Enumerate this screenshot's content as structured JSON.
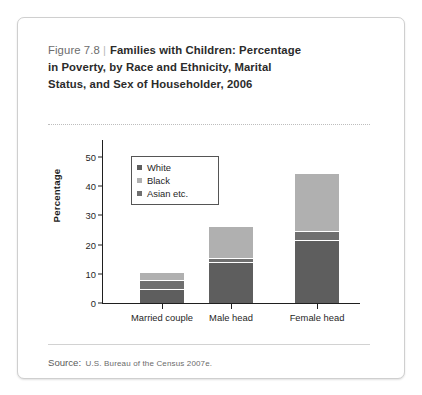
{
  "figure": {
    "number_label": "Figure 7.8",
    "separator": "|",
    "title_line1": "Families with Children: Percentage",
    "title_line2": "in Poverty, by Race and Ethnicity, Marital",
    "title_line3": "Status, and Sex of Householder, 2006",
    "source_label": "Source:",
    "source_text": "U.S. Bureau of the Census 2007e."
  },
  "colors": {
    "white_series": "#5e5e5e",
    "black_series": "#b0b0b0",
    "asian_series": "#6f6f6f",
    "axis": "#1f1f1f",
    "card_border": "#cfcfcf",
    "divider": "#bdbdbd"
  },
  "chart_data": {
    "type": "bar",
    "stacked": true,
    "title": "Families with Children: Percentage in Poverty, by Race and Ethnicity, Marital Status, and Sex of Householder, 2006",
    "xlabel": "",
    "ylabel": "Percentage",
    "ylim": [
      0,
      50
    ],
    "yticks": [
      0,
      10,
      20,
      30,
      40,
      50
    ],
    "ytick_labels": [
      "0",
      "10",
      "20",
      "30",
      "40",
      "50"
    ],
    "grid": false,
    "legend_position": "upper-left-inside",
    "categories": [
      "Married couple",
      "Male head",
      "Female head"
    ],
    "series": [
      {
        "name": "White",
        "values": [
          4.8,
          14.0,
          21.5
        ]
      },
      {
        "name": "Asian etc.",
        "values": [
          3.2,
          1.3,
          3.0
        ]
      },
      {
        "name": "Black",
        "values": [
          2.5,
          11.0,
          20.0
        ]
      }
    ],
    "totals": [
      10.5,
      26.3,
      44.5
    ]
  }
}
